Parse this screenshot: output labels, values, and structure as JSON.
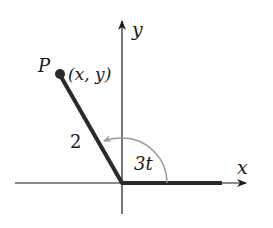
{
  "diagram": {
    "type": "polar-angle-figure",
    "axes": {
      "x_label": "x",
      "y_label": "y"
    },
    "point": {
      "name": "P",
      "coords_label": "(x, y)"
    },
    "segment_length_label": "2",
    "angle_label": "3t",
    "colors": {
      "line": "#2a2a2a",
      "arc": "#9a9a9a",
      "axis": "#1a1a1a"
    }
  }
}
